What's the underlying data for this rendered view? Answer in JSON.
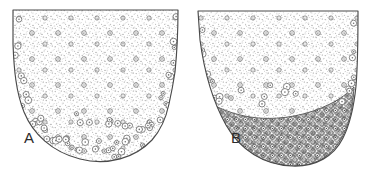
{
  "figure": {
    "type": "histological-line-drawing",
    "background_color": "#ffffff",
    "ink_color": "#3a3a3a",
    "width": 375,
    "height": 173,
    "panels": [
      {
        "id": "A",
        "label": "A",
        "label_x": 24,
        "label_y": 143,
        "description": "Tapering tissue section with fine stipple texture throughout and scattered ring-shaped cells concentrated along the lower margin",
        "outline_color": "#4a4a4a",
        "stipple_color": "#8a8a8a",
        "cell_ring_color": "#707070",
        "outline_path": "M13,10 L13,44 C14,70 16,92 24,112 C33,134 52,152 80,159 C108,166 135,158 152,140 C161,130 166,118 169,104 C171,95 173,85 175,72 C177,52 178,30 178,10 Z",
        "dark_band": false
      },
      {
        "id": "B",
        "label": "B",
        "label_x": 231,
        "label_y": 143,
        "description": "Tapering tissue section with fine stipple texture and a dense darkly-stained band of closely packed cells occupying the lower third",
        "outline_color": "#4a4a4a",
        "stipple_color": "#8a8a8a",
        "cell_ring_color": "#707070",
        "outline_path": "M198,11 L200,40 C204,70 212,100 226,125 C240,150 264,165 292,166 C316,167 334,156 343,138 C350,124 354,106 356,86 C358,62 358,34 358,11 Z",
        "dark_band": true,
        "dark_band_color": "#6f6f6f",
        "dark_band_path": "M210,103 C222,110 238,116 258,118 C282,120 308,115 330,104 C340,99 348,93 354,87 C353,108 349,126 341,139 C331,157 314,167 291,166 C263,165 240,150 226,126 C219,113 214,108 210,103 Z"
      }
    ],
    "caption": ""
  }
}
